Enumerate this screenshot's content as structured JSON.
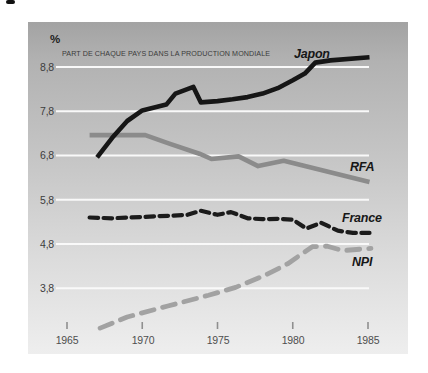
{
  "figure": {
    "percent_label": "%",
    "subtitle": "PART DE CHAQUE PAYS DANS LA PRODUCTION MONDIALE"
  },
  "colors": {
    "panel_top": "#a3a3a3",
    "panel_bottom": "#eeeeee",
    "gridline": "#f9f9f9",
    "tick": "#8f8f8f",
    "japon_line": "#161616",
    "rfa_line": "#8b8b8b",
    "france_line": "#1b1b1b",
    "npi_line": "#a2a2a2"
  },
  "chart_data": {
    "type": "line",
    "title": "PART DE CHAQUE PAYS DANS LA PRODUCTION MONDIALE",
    "ylabel": "%",
    "xlabel": "",
    "grid": true,
    "legend_position": "inline-labels",
    "x_range": [
      1965,
      1985
    ],
    "y_range": [
      2.8,
      9.3
    ],
    "x_ticks": [
      1965,
      1970,
      1975,
      1980,
      1985
    ],
    "x_tick_labels": [
      "1965",
      "1970",
      "1975",
      "1980",
      "1985"
    ],
    "y_ticks": [
      8.8,
      7.8,
      6.8,
      5.8,
      4.8,
      3.8
    ],
    "y_tick_labels": [
      "8,8",
      "7,8",
      "6,8",
      "5,8",
      "4,8",
      "3,8"
    ],
    "series": [
      {
        "name": "RFA",
        "color": "#8b8b8b",
        "style": "solid",
        "width": 4.6,
        "points": [
          [
            1966.5,
            7.26
          ],
          [
            1970.2,
            7.26
          ],
          [
            1971.8,
            7.07
          ],
          [
            1973.8,
            6.84
          ],
          [
            1974.6,
            6.72
          ],
          [
            1976.4,
            6.78
          ],
          [
            1977.7,
            6.56
          ],
          [
            1979.4,
            6.68
          ],
          [
            1985.1,
            6.2
          ]
        ]
      },
      {
        "name": "NPI",
        "color": "#a2a2a2",
        "style": "dashed",
        "width": 4.8,
        "dash": "13 9",
        "points": [
          [
            1967.2,
            2.9
          ],
          [
            1969,
            3.15
          ],
          [
            1971.7,
            3.4
          ],
          [
            1974.4,
            3.64
          ],
          [
            1976.2,
            3.82
          ],
          [
            1978.2,
            4.1
          ],
          [
            1979.7,
            4.36
          ],
          [
            1980.7,
            4.6
          ],
          [
            1981.3,
            4.74
          ],
          [
            1982.3,
            4.75
          ],
          [
            1983.3,
            4.65
          ],
          [
            1985.2,
            4.7
          ]
        ]
      },
      {
        "name": "France",
        "color": "#1b1b1b",
        "style": "dashed",
        "width": 4.2,
        "dash": "8.5 5.5",
        "points": [
          [
            1966.5,
            5.4
          ],
          [
            1968,
            5.38
          ],
          [
            1969,
            5.4
          ],
          [
            1970,
            5.41
          ],
          [
            1971,
            5.43
          ],
          [
            1972,
            5.44
          ],
          [
            1973,
            5.46
          ],
          [
            1973.9,
            5.55
          ],
          [
            1975,
            5.46
          ],
          [
            1975.9,
            5.52
          ],
          [
            1977,
            5.38
          ],
          [
            1978,
            5.36
          ],
          [
            1979,
            5.37
          ],
          [
            1980,
            5.35
          ],
          [
            1980.9,
            5.15
          ],
          [
            1981.9,
            5.28
          ],
          [
            1983,
            5.1
          ],
          [
            1984,
            5.05
          ],
          [
            1985.1,
            5.05
          ]
        ]
      },
      {
        "name": "Japon",
        "color": "#161616",
        "style": "solid",
        "width": 4.6,
        "points": [
          [
            1967,
            6.76
          ],
          [
            1968,
            7.2
          ],
          [
            1969,
            7.58
          ],
          [
            1970,
            7.82
          ],
          [
            1971,
            7.9
          ],
          [
            1971.6,
            7.95
          ],
          [
            1972.2,
            8.2
          ],
          [
            1973.4,
            8.35
          ],
          [
            1973.9,
            8.0
          ],
          [
            1975,
            8.03
          ],
          [
            1976,
            8.07
          ],
          [
            1977,
            8.12
          ],
          [
            1978,
            8.2
          ],
          [
            1979,
            8.32
          ],
          [
            1980,
            8.5
          ],
          [
            1980.8,
            8.65
          ],
          [
            1981.5,
            8.9
          ],
          [
            1982.5,
            8.95
          ],
          [
            1985.1,
            9.02
          ]
        ]
      }
    ],
    "series_labels": [
      {
        "text": "Japon"
      },
      {
        "text": "RFA"
      },
      {
        "text": "France"
      },
      {
        "text": "NPI"
      }
    ]
  }
}
